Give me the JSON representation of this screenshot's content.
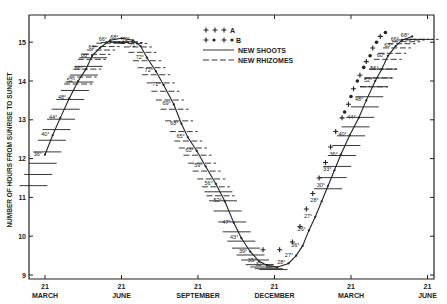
{
  "chart_data": {
    "type": "line",
    "title": "",
    "ylabel": "NUMBER OF HOURS FROM SUNRISE TO SUNSET",
    "xlabel": "",
    "ylim": [
      9,
      15.5
    ],
    "yticks": [
      9,
      10,
      11,
      12,
      13,
      14,
      15
    ],
    "xticks": [
      {
        "day": "21",
        "month": "MARCH"
      },
      {
        "day": "21",
        "month": "JUNE"
      },
      {
        "day": "21",
        "month": "SEPTEMBER"
      },
      {
        "day": "21",
        "month": "DECEMBER"
      },
      {
        "day": "21",
        "month": "MARCH"
      },
      {
        "day": "21",
        "month": "JUNE"
      }
    ],
    "xlim_months": [
      -0.6,
      15.1
    ],
    "legend": {
      "placement": "top-center",
      "entries": [
        {
          "marker": "+ + +",
          "label": "A"
        },
        {
          "marker": "+ • + •",
          "label": "B"
        },
        {
          "marker": "solid-line",
          "label": "NEW SHOOTS"
        },
        {
          "marker": "dashed-line",
          "label": "NEW RHIZOMES"
        }
      ]
    },
    "daylength_curve": [
      {
        "m": 0.0,
        "h": 12.1,
        "t": "36°"
      },
      {
        "m": 0.3,
        "h": 12.6,
        "t": "40°"
      },
      {
        "m": 0.6,
        "h": 13.05,
        "t": "44°"
      },
      {
        "m": 0.95,
        "h": 13.55,
        "t": "48°"
      },
      {
        "m": 1.3,
        "h": 14.0,
        "t": "52°"
      },
      {
        "m": 1.6,
        "h": 14.3,
        "t": "56°"
      },
      {
        "m": 1.85,
        "h": 14.65,
        "t": "60°"
      },
      {
        "m": 2.15,
        "h": 14.85,
        "t": "63°"
      },
      {
        "m": 2.55,
        "h": 15.05,
        "t": "66°"
      },
      {
        "m": 3.0,
        "h": 15.1,
        "t": "68°"
      },
      {
        "m": 3.45,
        "h": 15.05,
        "t": "70°"
      },
      {
        "m": 3.75,
        "h": 14.9,
        "t": "71°"
      },
      {
        "m": 4.0,
        "h": 14.6,
        "t": "72°"
      },
      {
        "m": 4.35,
        "h": 14.25,
        "t": "72°"
      },
      {
        "m": 4.65,
        "h": 13.9,
        "t": "71°"
      },
      {
        "m": 5.05,
        "h": 13.4,
        "t": "69°"
      },
      {
        "m": 5.35,
        "h": 12.9,
        "t": "68°"
      },
      {
        "m": 5.6,
        "h": 12.55,
        "t": "65°"
      },
      {
        "m": 5.95,
        "h": 12.2,
        "t": "63°"
      },
      {
        "m": 6.3,
        "h": 11.8,
        "t": "59°"
      },
      {
        "m": 6.7,
        "h": 11.35,
        "t": "56°"
      },
      {
        "m": 7.05,
        "h": 10.9,
        "t": "52°"
      },
      {
        "m": 7.4,
        "h": 10.35,
        "t": "47°"
      },
      {
        "m": 7.7,
        "h": 9.95,
        "t": "43°"
      },
      {
        "m": 8.05,
        "h": 9.6,
        "t": "39°"
      },
      {
        "m": 8.4,
        "h": 9.35,
        "t": "35°"
      },
      {
        "m": 8.7,
        "h": 9.25,
        "t": "32°"
      },
      {
        "m": 9.1,
        "h": 9.2,
        "t": "30°"
      },
      {
        "m": 9.55,
        "h": 9.3,
        "t": "28°"
      },
      {
        "m": 9.85,
        "h": 9.5,
        "t": "27°"
      },
      {
        "m": 10.1,
        "h": 9.75,
        "t": "26°"
      },
      {
        "m": 10.35,
        "h": 10.15,
        "t": "26°"
      },
      {
        "m": 10.6,
        "h": 10.5,
        "t": "27°"
      },
      {
        "m": 10.85,
        "h": 10.9,
        "t": "28°"
      },
      {
        "m": 11.1,
        "h": 11.3,
        "t": "30°"
      },
      {
        "m": 11.35,
        "h": 11.7,
        "t": "33°"
      },
      {
        "m": 11.6,
        "h": 12.1,
        "t": "36°"
      },
      {
        "m": 11.95,
        "h": 12.6,
        "t": "40°"
      },
      {
        "m": 12.3,
        "h": 13.05,
        "t": "44°"
      },
      {
        "m": 12.6,
        "h": 13.5,
        "t": "48°"
      },
      {
        "m": 12.95,
        "h": 14.0,
        "t": "52°"
      },
      {
        "m": 13.2,
        "h": 14.3,
        "t": "56°"
      },
      {
        "m": 13.45,
        "h": 14.65,
        "t": "60°"
      },
      {
        "m": 13.75,
        "h": 14.9,
        "t": "63°"
      },
      {
        "m": 14.0,
        "h": 15.05,
        "t": "66°"
      },
      {
        "m": 14.4,
        "h": 15.15,
        "t": "68°"
      }
    ],
    "series_A_plus": [
      {
        "m": 8.55,
        "h": 9.65
      },
      {
        "m": 9.2,
        "h": 9.65
      },
      {
        "m": 9.7,
        "h": 9.85
      },
      {
        "m": 10.0,
        "h": 10.25
      },
      {
        "m": 10.25,
        "h": 10.7
      },
      {
        "m": 10.5,
        "h": 11.1
      },
      {
        "m": 10.75,
        "h": 11.5
      },
      {
        "m": 11.0,
        "h": 11.9
      },
      {
        "m": 11.2,
        "h": 12.3
      },
      {
        "m": 11.4,
        "h": 12.7
      },
      {
        "m": 11.65,
        "h": 13.05
      },
      {
        "m": 11.9,
        "h": 13.4
      },
      {
        "m": 12.1,
        "h": 13.8
      },
      {
        "m": 12.35,
        "h": 14.15
      },
      {
        "m": 12.6,
        "h": 14.5
      },
      {
        "m": 12.85,
        "h": 14.85
      },
      {
        "m": 13.15,
        "h": 15.15
      }
    ],
    "series_B_dots": [
      {
        "m": 11.75,
        "h": 13.2
      },
      {
        "m": 12.0,
        "h": 13.6
      },
      {
        "m": 12.25,
        "h": 14.0
      },
      {
        "m": 12.5,
        "h": 14.35
      },
      {
        "m": 12.75,
        "h": 14.65
      },
      {
        "m": 13.0,
        "h": 15.0
      },
      {
        "m": 13.35,
        "h": 15.25
      }
    ],
    "new_shoots_periods": [
      {
        "from_m": -0.45,
        "to_m": 2.0
      },
      {
        "from_m": 6.8,
        "to_m": 9.05
      },
      {
        "from_m": 11.1,
        "to_m": 13.3
      }
    ],
    "new_rhizomes_periods": [
      {
        "from_m": 1.3,
        "to_m": 7.0
      },
      {
        "from_m": 12.9,
        "to_m": 14.9
      }
    ]
  }
}
